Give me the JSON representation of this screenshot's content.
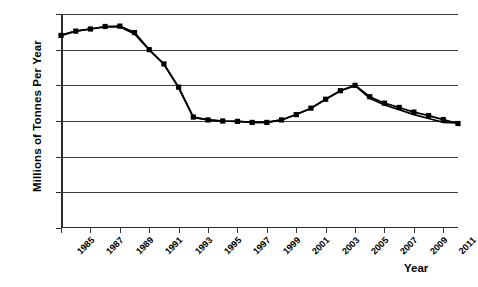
{
  "chart_data": {
    "type": "line",
    "title": "",
    "xlabel": "Year",
    "ylabel": "Millions of Tonnes Per Year",
    "xlim": [
      1985,
      2012
    ],
    "ylim": [
      0,
      600
    ],
    "yticks": [
      0,
      100,
      200,
      300,
      400,
      500,
      600
    ],
    "xticks": [
      1985,
      1987,
      1989,
      1991,
      1993,
      1995,
      1997,
      1999,
      2001,
      2003,
      2005,
      2007,
      2009,
      2011
    ],
    "grid": true,
    "legend": "none",
    "marker": "square",
    "x": [
      1985,
      1986,
      1987,
      1988,
      1989,
      1990,
      1991,
      1992,
      1993,
      1994,
      1995,
      1996,
      1997,
      1998,
      1999,
      2000,
      2001,
      2002,
      2003,
      2004,
      2005,
      2006,
      2007,
      2008,
      2009,
      2010,
      2011,
      2012
    ],
    "series": [
      {
        "name": "Series 1",
        "values": [
          540,
          552,
          558,
          565,
          566,
          548,
          500,
          460,
          395,
          311,
          303,
          300,
          299,
          296,
          296,
          303,
          318,
          336,
          361,
          385,
          400,
          368,
          350,
          338,
          325,
          315,
          304,
          293
        ]
      },
      {
        "name": "Series 2",
        "values": [
          540,
          552,
          558,
          564,
          564,
          544,
          499,
          459,
          393,
          310,
          303,
          300,
          299,
          296,
          296,
          303,
          318,
          336,
          361,
          385,
          399,
          364,
          345,
          332,
          318,
          307,
          296,
          295
        ]
      }
    ]
  },
  "axis": {
    "y_tick_labels": [
      "600",
      "500",
      "400",
      "300",
      "200",
      "100",
      "0"
    ],
    "x_tick_labels": [
      "1985",
      "1987",
      "1989",
      "1991",
      "1993",
      "1995",
      "1997",
      "1999",
      "2001",
      "2003",
      "2005",
      "2007",
      "2009",
      "2011"
    ],
    "x_title": "Year",
    "y_title": "Millions of Tonnes Per Year"
  },
  "colors": {
    "line": "#000000",
    "marker": "#000000",
    "grid": "#3a3a3a",
    "axis": "#2b2b2b",
    "background": "#ffffff"
  }
}
